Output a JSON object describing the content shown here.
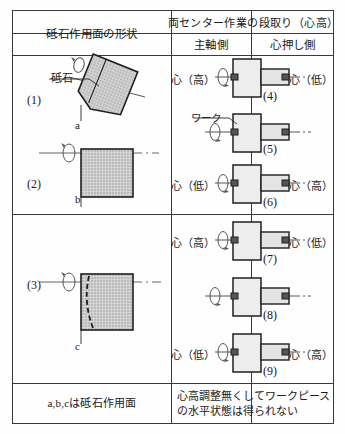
{
  "table": {
    "header": {
      "left_column": "砥石作用面の形状",
      "right_column": "両センター作業の段取り（心高）",
      "right_sub_a": "主軸側",
      "right_sub_b": "心押し側"
    },
    "footer": {
      "left_note": "a,b,cは砥石作用面",
      "right_note_line1": "心高調整無くしてワークピース",
      "right_note_line2": "の水平状態は得られない"
    },
    "left_figures": [
      {
        "number": "(1)",
        "wheel_label": "砥石",
        "surface_point": "a",
        "shape": "tilted-wheel",
        "description": "傾斜した砥石作用面"
      },
      {
        "number": "(2)",
        "wheel_label": "",
        "surface_point": "b",
        "shape": "straight-wheel",
        "description": "平行な砥石作用面"
      },
      {
        "number": "(3)",
        "wheel_label": "",
        "surface_point": "c",
        "shape": "curved-wheel",
        "description": "湾曲した砥石作用面"
      }
    ],
    "right_rows": [
      {
        "number": "(4)",
        "left_label": "心（高）",
        "right_label": "心（低）",
        "work_label": "",
        "center_line": "solid-left-dashed-right"
      },
      {
        "number": "(5)",
        "left_label": "",
        "right_label": "",
        "work_label": "ワーク",
        "center_line": "dashed"
      },
      {
        "number": "(6)",
        "left_label": "心（低）",
        "right_label": "心（高）",
        "work_label": "",
        "center_line": "solid-left-dashed-right"
      },
      {
        "number": "(7)",
        "left_label": "心（高）",
        "right_label": "心（低）",
        "work_label": "",
        "center_line": "solid-left-dashed-right"
      },
      {
        "number": "(8)",
        "left_label": "",
        "right_label": "",
        "work_label": "",
        "center_line": "dashed"
      },
      {
        "number": "(9)",
        "left_label": "心（低）",
        "right_label": "心（高）",
        "work_label": "",
        "center_line": "solid-left-dashed-right"
      }
    ],
    "colors": {
      "border": "#3a3a3a",
      "wheel_fill": "#c9c9c9",
      "work_fill": "#eeeeee",
      "line": "#2b2b2b",
      "text": "#1a1a1a"
    }
  }
}
